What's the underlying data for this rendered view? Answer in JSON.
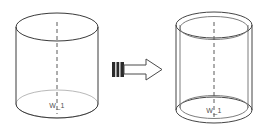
{
  "diagram": {
    "background_color": "#ffffff",
    "line_color": "#3a3a3a",
    "faint_line_color": "#b9b9b9",
    "axis_color": "#5b5b5b",
    "arrow_tail_color": "#2b2b2b",
    "arrow_head_fill": "#ffffff"
  },
  "shapes": {
    "source": {
      "name": "solid-cylinder",
      "label": "W_1",
      "axis_style": "dashed",
      "wall": "single",
      "center_x": 57,
      "top_y": 27,
      "bottom_y": 104,
      "radius_x": 41,
      "radius_y": 14
    },
    "result": {
      "name": "hollow-cylinder",
      "label": "W_1",
      "axis_style": "dashed",
      "wall": "double",
      "center_x": 214,
      "top_y": 25,
      "bottom_y": 110,
      "radius_x": 38,
      "radius_y": 13,
      "wall_thickness": 4
    }
  },
  "arrow": {
    "name": "transform-arrow",
    "direction": "right",
    "tail_stripes": 2,
    "x": 112,
    "y": 59,
    "width": 50,
    "height": 21
  }
}
